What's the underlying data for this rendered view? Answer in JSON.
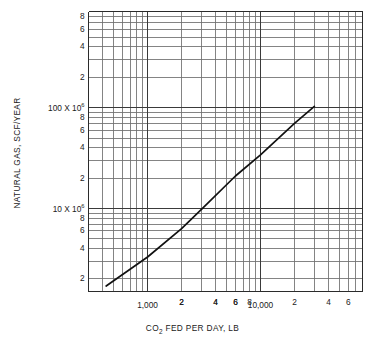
{
  "chart_data": {
    "type": "line",
    "title": "",
    "xlabel": "CO2 FED PER DAY, LB",
    "ylabel": "NATURAL GAS, SCF/YEAR",
    "xscale": "log",
    "yscale": "log",
    "xlim": [
      300,
      80000
    ],
    "ylim": [
      1500000,
      900000000
    ],
    "grid": true,
    "legend": null,
    "xticks_labeled": [
      {
        "value": 2000,
        "label": "2"
      },
      {
        "value": 4000,
        "label": "4"
      },
      {
        "value": 6000,
        "label": "6"
      },
      {
        "value": 1000,
        "label": "1,000"
      },
      {
        "value": 20000,
        "label": "2"
      },
      {
        "value": 40000,
        "label": "4"
      },
      {
        "value": 60000,
        "label": "6"
      },
      {
        "value": 10000,
        "label": "10,000"
      },
      {
        "value": 2000000,
        "label": "2"
      },
      {
        "value": 4000000,
        "label": "4"
      },
      {
        "value": 6000000,
        "label": "6"
      },
      {
        "value": 8000000,
        "label": "8"
      }
    ],
    "yticks_labeled": [
      {
        "value": 2000000,
        "label": "2"
      },
      {
        "value": 4000000,
        "label": "4"
      },
      {
        "value": 6000000,
        "label": "6"
      },
      {
        "value": 8000000,
        "label": "8"
      },
      {
        "value": 10000000,
        "label": "10 X 10"
      },
      {
        "value": 20000000,
        "label": "2"
      },
      {
        "value": 40000000,
        "label": "4"
      },
      {
        "value": 60000000,
        "label": "6"
      },
      {
        "value": 80000000,
        "label": "8"
      },
      {
        "value": 100000000,
        "label": "100 X 10"
      },
      {
        "value": 200000000,
        "label": "2"
      },
      {
        "value": 400000000,
        "label": "4"
      },
      {
        "value": 600000000,
        "label": "6"
      },
      {
        "value": 800000000,
        "label": "8"
      }
    ],
    "exponent_suffix": "6",
    "series": [
      {
        "name": "natural gas vs CO2 fed",
        "x": [
          430,
          1000,
          2000,
          3000,
          6000,
          10000,
          20000,
          30000
        ],
        "y": [
          1700000,
          3300000,
          6300000,
          9800000,
          21000000,
          34000000,
          70000000,
          103000000
        ]
      }
    ],
    "annotations": []
  },
  "axis_titles": {
    "x_prefix": "CO",
    "x_sub": "2",
    "x_rest": " FED PER DAY, LB",
    "y": "NATURAL GAS, SCF/YEAR"
  }
}
